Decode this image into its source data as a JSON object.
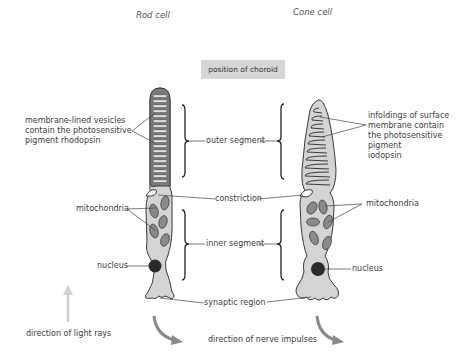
{
  "titles": {
    "rod": "Rod cell",
    "cone": "Cone cell"
  },
  "choroid_label": "position of choroid",
  "rod_labels": {
    "vesicles": [
      "membrane-lined vesicles",
      "contain the photosensitive",
      "pigment rhodopsin"
    ],
    "mitochondria": "mitochondria",
    "nucleus": "nucleus"
  },
  "center_labels": {
    "outer_segment": "outer segment",
    "constriction": "constriction",
    "inner_segment": "inner segment",
    "synaptic_region": "synaptic region"
  },
  "cone_labels": {
    "infoldings": [
      "infoldings of surface",
      "membrane contain",
      "the photosensitive",
      "pigment",
      "iodopsin"
    ],
    "mitochondria": "mitochondria",
    "nucleus": "nucleus"
  },
  "bottom_labels": {
    "light": "direction of light rays",
    "nerve": "direction of nerve impulses"
  },
  "colors": {
    "cell_fill": "#d4d4d4",
    "outline": "#3a3a3a",
    "rod_outer_fill": "#7a7a7a",
    "nucleus": "#2a2a2a",
    "arrow": "#8a8a8a",
    "light_arrow": "#cfcfcf"
  }
}
